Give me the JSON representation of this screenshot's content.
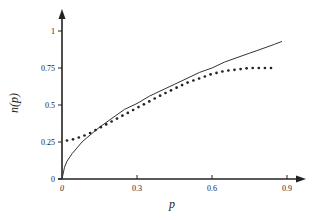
{
  "chart_data": {
    "type": "line",
    "title": "",
    "xlabel": "p",
    "ylabel": "n(p)",
    "xlim": [
      0,
      0.95
    ],
    "ylim": [
      0,
      1.1
    ],
    "x_ticks": [
      "0",
      "0.3",
      "0.6",
      "0.9"
    ],
    "y_ticks": [
      "0",
      "0.25",
      "0.5",
      "0.75",
      "1"
    ],
    "grid": false,
    "legend": null,
    "series": [
      {
        "name": "solid",
        "style": "solid",
        "color": "#333333",
        "x": [
          0.0,
          0.01,
          0.02,
          0.04,
          0.06,
          0.08,
          0.1,
          0.15,
          0.2,
          0.25,
          0.3,
          0.35,
          0.4,
          0.45,
          0.5,
          0.55,
          0.6,
          0.65,
          0.7,
          0.75,
          0.8,
          0.85,
          0.88
        ],
        "values": [
          0.0,
          0.08,
          0.12,
          0.17,
          0.21,
          0.25,
          0.28,
          0.35,
          0.41,
          0.47,
          0.51,
          0.56,
          0.6,
          0.64,
          0.68,
          0.72,
          0.75,
          0.79,
          0.82,
          0.85,
          0.88,
          0.91,
          0.93
        ]
      },
      {
        "name": "dotted",
        "style": "dotted",
        "color": "#222222",
        "x": [
          0.02,
          0.05,
          0.1,
          0.15,
          0.2,
          0.25,
          0.3,
          0.35,
          0.4,
          0.45,
          0.5,
          0.55,
          0.6,
          0.65,
          0.7,
          0.75,
          0.8,
          0.86
        ],
        "values": [
          0.26,
          0.27,
          0.3,
          0.345,
          0.39,
          0.435,
          0.48,
          0.525,
          0.57,
          0.61,
          0.65,
          0.68,
          0.71,
          0.73,
          0.74,
          0.75,
          0.75,
          0.75
        ]
      }
    ]
  }
}
